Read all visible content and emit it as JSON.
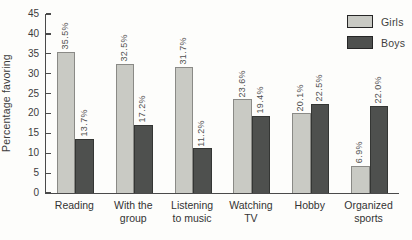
{
  "chart_data": {
    "type": "bar",
    "title": "",
    "ylabel": "Percentage favoring",
    "xlabel": "",
    "ylim": [
      0,
      45
    ],
    "yticks": [
      0,
      5,
      10,
      15,
      20,
      25,
      30,
      35,
      40,
      45
    ],
    "grid": false,
    "legend_position": "top-right",
    "value_label_rotation": -90,
    "categories": [
      "Reading",
      "With the\ngroup",
      "Listening\nto music",
      "Watching\nTV",
      "Hobby",
      "Organized\nsports"
    ],
    "series": [
      {
        "name": "Girls",
        "values": [
          35.5,
          32.5,
          31.7,
          23.6,
          20.1,
          6.9
        ],
        "labels": [
          "35.5%",
          "32.5%",
          "31.7%",
          "23.6%",
          "20.1%",
          "6.9%"
        ],
        "color": "#c9cac4",
        "border": "#8a8a86"
      },
      {
        "name": "Boys",
        "values": [
          13.7,
          17.2,
          11.2,
          19.4,
          22.5,
          22.0
        ],
        "labels": [
          "13.7%",
          "17.2%",
          "11.2%",
          "19.4%",
          "22.5%",
          "22.0%"
        ],
        "color": "#4e504e",
        "border": "#343634"
      }
    ]
  },
  "colors": {
    "background": "#fdfdfb",
    "axis": "#4a4a4a",
    "text": "#3c3c3c",
    "value_label": "#4f4f4f"
  }
}
